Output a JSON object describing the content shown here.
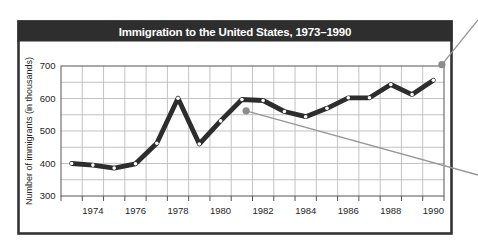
{
  "figure": {
    "title": "Immigration to the United States, 1973–1990",
    "title_bar_color": "#2e2e2e",
    "title_text_color": "#ffffff",
    "frame_color": "#333333",
    "background": "#ffffff"
  },
  "chart_data": {
    "type": "line",
    "title": "Immigration to the United States, 1973–1990",
    "xlabel": "",
    "ylabel": "Number of immigrants (in thousands)",
    "x": [
      1973,
      1974,
      1975,
      1976,
      1977,
      1978,
      1979,
      1980,
      1981,
      1982,
      1983,
      1984,
      1985,
      1986,
      1987,
      1988,
      1989,
      1990
    ],
    "series": [
      {
        "name": "Immigrants admitted (in thousands)",
        "values": [
          400,
          395,
          386,
          399,
          462,
          601,
          460,
          531,
          597,
          594,
          560,
          544,
          570,
          602,
          602,
          643,
          612,
          656
        ]
      }
    ],
    "ylim": [
      300,
      700
    ],
    "y_grid_step": 50,
    "x_tick_labels": [
      "1974",
      "1976",
      "1978",
      "1980",
      "1982",
      "1984",
      "1986",
      "1988",
      "1990"
    ],
    "y_tick_labels": [
      "700",
      "600",
      "500",
      "400",
      "300"
    ],
    "grid": "on",
    "legend": "none",
    "line_color": "#2d2d2d",
    "grid_color": "#bcbcbc",
    "marker": "white-open-circle",
    "annotations": [
      {
        "type": "leader-dot",
        "x": 1990.4,
        "y": 704,
        "color": "#8c8c8c",
        "leader_exit": "top-right edge (label cropped out of view)"
      },
      {
        "type": "leader-dot",
        "x": 1981.2,
        "y": 562,
        "color": "#8c8c8c",
        "leader_exit": "right edge (label cropped out of view)"
      }
    ]
  }
}
